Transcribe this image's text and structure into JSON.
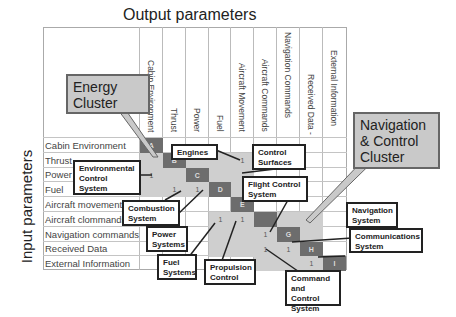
{
  "titles": {
    "output": "Output parameters",
    "input": "Input parameters"
  },
  "columns": [
    "Cabin Environment",
    "Thrust",
    "Power",
    "Fuel",
    "Aircraft Movement",
    "Aircraft Commands",
    "Navigation Commands",
    "Received Data -",
    "External Information"
  ],
  "rows": [
    "Cabin Environment",
    "Thrust",
    "Power",
    "Fuel",
    "Aircraft movement",
    "Aircraft clommands",
    "Navigation commands",
    "Received Data",
    "External Information"
  ],
  "matrix": {
    "diagonal": [
      "A",
      "B",
      "C",
      "D",
      "E",
      "F",
      "G",
      "H",
      "I"
    ],
    "dependency_mark": "1"
  },
  "clusters": {
    "energy": "Energy Cluster",
    "energy_l1": "Energy",
    "energy_l2": "Cluster",
    "nav_l1": "Navigation",
    "nav_l2": "& Control",
    "nav_l3": "Cluster"
  },
  "callouts": {
    "engines": "Engines",
    "control_surfaces_l1": "Control",
    "control_surfaces_l2": "Surfaces",
    "env_l1": "Environmental",
    "env_l2": "Control",
    "env_l3": "System",
    "flight_l1": "Flight Control",
    "flight_l2": "System",
    "combustion_l1": "Combustion",
    "combustion_l2": "System",
    "power_l1": "Power",
    "power_l2": "Systems",
    "fuel_l1": "Fuel",
    "fuel_l2": "Systems",
    "propulsion_l1": "Propulsion",
    "propulsion_l2": "Control",
    "nav_l1": "Navigation",
    "nav_l2": "System",
    "comm_l1": "Communications",
    "comm_l2": "System",
    "cmd_l1": "Command",
    "cmd_l2": "and Control",
    "cmd_l3": "System"
  },
  "colors": {
    "cluster_fill": "#cfcfcf",
    "diagonal_fill": "#6d6d6d",
    "grid_line": "#c4c4c4"
  }
}
